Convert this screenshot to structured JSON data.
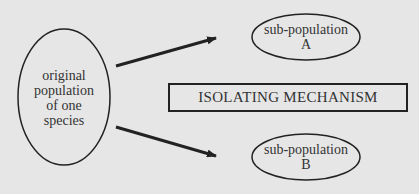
{
  "diagram": {
    "source_node": {
      "lines": [
        "original",
        "population",
        "of one",
        "species"
      ]
    },
    "sub_population_a": {
      "line1": "sub-population",
      "line2": "A"
    },
    "sub_population_b": {
      "line1": "sub-population",
      "line2": "B"
    },
    "mechanism_box": {
      "label": "ISOLATING MECHANISM"
    },
    "colors": {
      "background": "#e6e6e6",
      "stroke": "#222222",
      "text": "#333333"
    }
  }
}
